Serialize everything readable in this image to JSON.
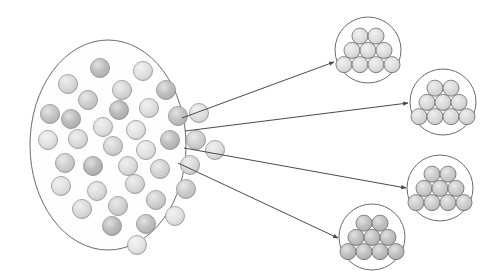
{
  "figure": {
    "title": "",
    "canvas": {
      "width": 499,
      "height": 280,
      "background": "#ffffff"
    },
    "style": {
      "outline_color": "#6b6b6b",
      "outline_width": 1,
      "arrow_color": "#4a4a4a",
      "arrow_width": 1,
      "particle_stroke": "#8a8a8a",
      "cluster_particle_stroke": "#6f6f6f"
    },
    "source_population": {
      "label": "heterogeneous particle population",
      "shape": "ellipse",
      "cx": 108,
      "cy": 145,
      "rx": 78,
      "ry": 105,
      "fill": "#fefefe",
      "stroke": "#6b6b6b",
      "particle_radius": 9.5,
      "particles": [
        {
          "x": 100,
          "y": 68,
          "shade": "#b4b4b4"
        },
        {
          "x": 143,
          "y": 71,
          "shade": "#dedede"
        },
        {
          "x": 68,
          "y": 84,
          "shade": "#d5d5d5"
        },
        {
          "x": 122,
          "y": 90,
          "shade": "#d2d2d2"
        },
        {
          "x": 166,
          "y": 90,
          "shade": "#b6b6b6"
        },
        {
          "x": 88,
          "y": 100,
          "shade": "#c8c8c8"
        },
        {
          "x": 119,
          "y": 110,
          "shade": "#b0b0b0"
        },
        {
          "x": 149,
          "y": 108,
          "shade": "#dbdbdb"
        },
        {
          "x": 50,
          "y": 114,
          "shade": "#bdbdbd"
        },
        {
          "x": 71,
          "y": 119,
          "shade": "#b2b2b2"
        },
        {
          "x": 178,
          "y": 116,
          "shade": "#b9b9b9"
        },
        {
          "x": 199,
          "y": 113,
          "shade": "#dcdcdc"
        },
        {
          "x": 103,
          "y": 127,
          "shade": "#dddddd"
        },
        {
          "x": 136,
          "y": 130,
          "shade": "#e2e2e2"
        },
        {
          "x": 48,
          "y": 140,
          "shade": "#e0e0e0"
        },
        {
          "x": 78,
          "y": 139,
          "shade": "#d8d8d8"
        },
        {
          "x": 113,
          "y": 146,
          "shade": "#d0d0d0"
        },
        {
          "x": 146,
          "y": 150,
          "shade": "#dfdfdf"
        },
        {
          "x": 170,
          "y": 140,
          "shade": "#b5b5b5"
        },
        {
          "x": 196,
          "y": 140,
          "shade": "#cbcbcb"
        },
        {
          "x": 215,
          "y": 150,
          "shade": "#dcdcdc"
        },
        {
          "x": 65,
          "y": 163,
          "shade": "#c9c9c9"
        },
        {
          "x": 93,
          "y": 166,
          "shade": "#b1b1b1"
        },
        {
          "x": 128,
          "y": 166,
          "shade": "#dadada"
        },
        {
          "x": 160,
          "y": 169,
          "shade": "#cfcfcf"
        },
        {
          "x": 190,
          "y": 165,
          "shade": "#d4d4d4"
        },
        {
          "x": 61,
          "y": 186,
          "shade": "#dededb"
        },
        {
          "x": 97,
          "y": 191,
          "shade": "#d9d9d9"
        },
        {
          "x": 135,
          "y": 184,
          "shade": "#d6d6d6"
        },
        {
          "x": 186,
          "y": 189,
          "shade": "#c6c6c6"
        },
        {
          "x": 82,
          "y": 209,
          "shade": "#d7d7d7"
        },
        {
          "x": 118,
          "y": 206,
          "shade": "#cdcdcd"
        },
        {
          "x": 156,
          "y": 200,
          "shade": "#cacaca"
        },
        {
          "x": 112,
          "y": 226,
          "shade": "#b3b3b3"
        },
        {
          "x": 146,
          "y": 224,
          "shade": "#b8b8b8"
        },
        {
          "x": 175,
          "y": 216,
          "shade": "#e1e1e1"
        },
        {
          "x": 137,
          "y": 245,
          "shade": "#e3e3e3"
        }
      ]
    },
    "arrows": [
      {
        "name": "arrow-to-cluster-1",
        "x1": 182,
        "y1": 118,
        "x2": 334,
        "y2": 62
      },
      {
        "name": "arrow-to-cluster-2",
        "x1": 185,
        "y1": 131,
        "x2": 408,
        "y2": 103
      },
      {
        "name": "arrow-to-cluster-3",
        "x1": 184,
        "y1": 148,
        "x2": 406,
        "y2": 188
      },
      {
        "name": "arrow-to-cluster-4",
        "x1": 178,
        "y1": 163,
        "x2": 338,
        "y2": 238
      }
    ],
    "clusters": [
      {
        "id": 1,
        "label": "cluster-1",
        "cx": 368,
        "cy": 50,
        "r": 33,
        "particle_radius": 8.0,
        "shade": "#dcdcdc",
        "rows": [
          2,
          3,
          4
        ],
        "outline": "#6b6b6b"
      },
      {
        "id": 2,
        "label": "cluster-2",
        "cx": 443,
        "cy": 102,
        "r": 33,
        "particle_radius": 8.0,
        "shade": "#d6d6d6",
        "rows": [
          2,
          3,
          4
        ],
        "outline": "#6b6b6b"
      },
      {
        "id": 3,
        "label": "cluster-3",
        "cx": 440,
        "cy": 188,
        "r": 33,
        "particle_radius": 8.0,
        "shade": "#c6c6c6",
        "rows": [
          2,
          3,
          4
        ],
        "outline": "#6b6b6b"
      },
      {
        "id": 4,
        "label": "cluster-4",
        "cx": 372,
        "cy": 237,
        "r": 33,
        "particle_radius": 8.0,
        "shade": "#b9b9b9",
        "rows": [
          2,
          3,
          4
        ],
        "outline": "#6b6b6b"
      }
    ]
  }
}
